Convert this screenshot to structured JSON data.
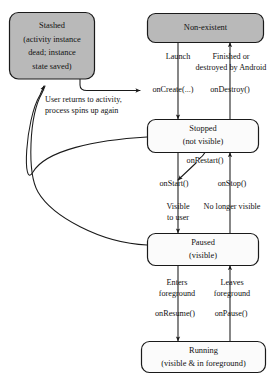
{
  "diagram": {
    "colors": {
      "stashed_fill": "#b9b9b9",
      "state_fill": "#fbfbfb",
      "stroke": "#1a1a1a",
      "background": "#ffffff",
      "text": "#111111"
    },
    "nodes": [
      {
        "id": "stashed",
        "name": "stashed-state",
        "filled": true,
        "lines": [
          "Stashed",
          "(activity instance",
          "dead; instance",
          "state saved)"
        ]
      },
      {
        "id": "non-existent",
        "name": "non-existent-state",
        "filled": true,
        "lines": [
          "Non-existent"
        ]
      },
      {
        "id": "stopped",
        "name": "stopped-state",
        "filled": false,
        "lines": [
          "Stopped",
          "(not visible)"
        ]
      },
      {
        "id": "paused",
        "name": "paused-state",
        "filled": false,
        "lines": [
          "Paused",
          "(visible)"
        ]
      },
      {
        "id": "running",
        "name": "running-state",
        "filled": false,
        "lines": [
          "Running",
          "(visible & in foreground)"
        ]
      }
    ],
    "edge_labels": {
      "launch": "Launch",
      "finished_1": "Finished or",
      "finished_2": "destroyed by Android",
      "on_create": "onCreate(...)",
      "on_destroy": "onDestroy()",
      "user_returns_1": "User returns to activity,",
      "user_returns_2": "process spins up again",
      "on_restart": "onRestart()",
      "on_start": "onStart()",
      "on_stop": "onStop()",
      "visible_1": "Visible",
      "visible_2": "to user",
      "no_longer_visible": "No longer visible",
      "enters_1": "Enters",
      "enters_2": "foreground",
      "leaves_1": "Leaves",
      "leaves_2": "foreground",
      "on_resume": "onResume()",
      "on_pause": "onPause()"
    }
  }
}
